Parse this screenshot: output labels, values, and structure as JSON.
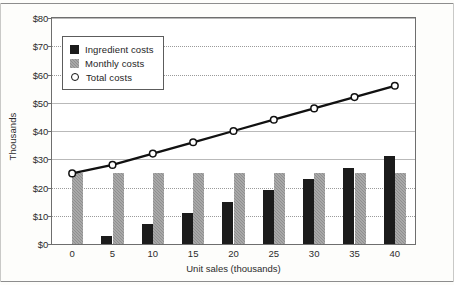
{
  "chart_data": {
    "type": "bar",
    "title": "",
    "xlabel": "Unit sales (thousands)",
    "ylabel": "Thousands",
    "categories": [
      "0",
      "5",
      "10",
      "15",
      "20",
      "25",
      "30",
      "35",
      "40"
    ],
    "x": [
      0,
      5,
      10,
      15,
      20,
      25,
      30,
      35,
      40
    ],
    "ylim": [
      0,
      80
    ],
    "ytick_values": [
      0,
      10,
      20,
      30,
      40,
      50,
      60,
      70,
      80
    ],
    "ytick_labels": [
      "$0",
      "$10",
      "$20",
      "$30",
      "$40",
      "$50",
      "$60",
      "$70",
      "$80"
    ],
    "grid": true,
    "legend_position": "upper left",
    "series": [
      {
        "name": "Ingredient costs",
        "type": "bar",
        "color": "#1b1b1b",
        "values": [
          0,
          3,
          7,
          11,
          15,
          19,
          23,
          27,
          31
        ]
      },
      {
        "name": "Monthly costs",
        "type": "bar",
        "color": "#8f8f8f",
        "values": [
          25,
          25,
          25,
          25,
          25,
          25,
          25,
          25,
          25
        ]
      },
      {
        "name": "Total costs",
        "type": "line",
        "color": "#111111",
        "marker": "circle-open",
        "values": [
          25,
          28,
          32,
          36,
          40,
          44,
          48,
          52,
          56
        ]
      }
    ]
  },
  "legend": {
    "items": [
      {
        "label": "Ingredient costs",
        "swatch": "filled-black-square"
      },
      {
        "label": "Monthly costs",
        "swatch": "filled-gray-square"
      },
      {
        "label": "Total costs",
        "swatch": "open-circle-marker"
      }
    ]
  },
  "axes": {
    "y_title": "Thousands",
    "x_title": "Unit sales (thousands)"
  }
}
